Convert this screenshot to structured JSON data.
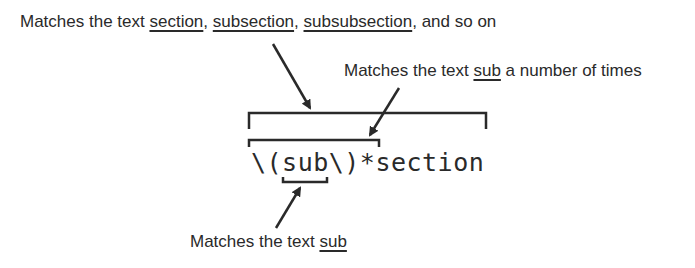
{
  "diagram": {
    "expression": "\\(sub\\)*section",
    "expression_parts": [
      "\\",
      "(",
      "sub",
      "\\",
      ")",
      "*",
      "section"
    ],
    "annotations": [
      {
        "id": "whole-expression",
        "prefix": "Matches the text ",
        "segments": [
          {
            "text": "section",
            "underlined": true
          },
          {
            "text": ", ",
            "underlined": false
          },
          {
            "text": "subsection",
            "underlined": true
          },
          {
            "text": ", ",
            "underlined": false
          },
          {
            "text": "subsubsection",
            "underlined": true
          },
          {
            "text": ", and so on",
            "underlined": false
          }
        ],
        "target": "\\(sub\\)*section"
      },
      {
        "id": "repeated-group",
        "prefix": "Matches the text ",
        "segments": [
          {
            "text": "sub",
            "underlined": true
          },
          {
            "text": " a number of times",
            "underlined": false
          }
        ],
        "target": "\\(sub\\)*"
      },
      {
        "id": "literal-sub",
        "prefix": "Matches the text ",
        "segments": [
          {
            "text": "sub",
            "underlined": true
          }
        ],
        "target": "sub"
      }
    ],
    "colors": {
      "ink": "#2a2a2a",
      "background": "#ffffff"
    }
  }
}
